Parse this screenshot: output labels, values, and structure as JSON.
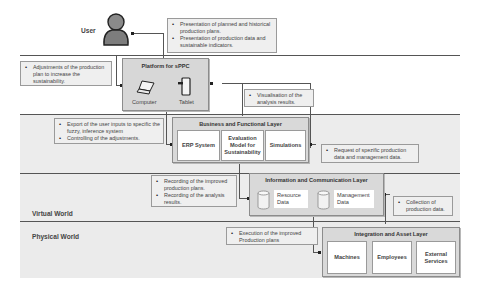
{
  "user": {
    "label": "User"
  },
  "zones": {
    "virtual": "Virtual World",
    "physical": "Physical World"
  },
  "platform": {
    "title": "Platform for sPPC",
    "devices": [
      {
        "label": "Computer",
        "icon": "laptop-icon"
      },
      {
        "label": "Tablet",
        "icon": "tablet-icon"
      }
    ]
  },
  "business_layer": {
    "title": "Business and Functional Layer",
    "cells": [
      "ERP System",
      "Evaluation Model for Sustainability",
      "Simulations"
    ]
  },
  "information_layer": {
    "title": "Information and Communication Layer",
    "stores": [
      {
        "label": "Resource Data",
        "icon": "database-icon"
      },
      {
        "label": "Management Data",
        "icon": "database-icon"
      }
    ]
  },
  "integration_layer": {
    "title": "Integration and  Asset Layer",
    "cells": [
      "Machines",
      "Employees",
      "External Services"
    ]
  },
  "notes": {
    "presentation": [
      "Presentation of planned and historical production plans.",
      "Presentation of production data and sustainable indicators."
    ],
    "adjustments": [
      "Adjustments of the production plan to increase the sustainability."
    ],
    "visualisation": [
      "Visualisation of the analysis results."
    ],
    "export": [
      "Export of the user inputs to specific the fuzzy, inference system",
      "Controlling of the adjustments."
    ],
    "request": [
      "Request of spezific production data  and management data."
    ],
    "recording": [
      "Recording of the improved production plans.",
      "Recording of the analysis results."
    ],
    "collection": [
      "Collection of production data."
    ],
    "execution": [
      "Execution of the improved Production plans"
    ]
  },
  "colors": {
    "band": "#ebebeb",
    "layer": "#d9d9d9",
    "cell": "#ffffff",
    "line": "#555555",
    "note": "#efefef"
  }
}
